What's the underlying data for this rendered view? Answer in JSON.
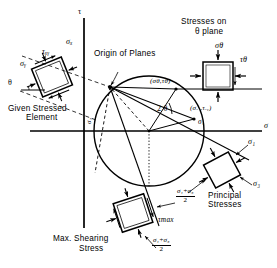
{
  "figure": {
    "type": "mohrs-circle-diagram",
    "title_implicit": "Mohr's Circle with Origin of Planes",
    "axes": {
      "vertical_label": "τ",
      "horizontal_label": "σ",
      "origin_px": [
        84,
        131
      ]
    },
    "colors": {
      "ink": "#000000",
      "paper": "#ffffff"
    },
    "annotations": {
      "origin_of_planes": "Origin of Planes",
      "given_stressed_element_line1": "Given  Stressed",
      "given_stressed_element_line2": "Element",
      "stresses_on_theta_line1": "Stresses on",
      "stresses_on_theta_line2": "θ plane",
      "principal_stresses_line1": "Principal",
      "principal_stresses_line2": "Stresses",
      "max_shearing_line1": "Max.  Shearing",
      "max_shearing_line2": "Stress",
      "angle_two_theta": "2 θ",
      "theta_angle": "θ"
    },
    "points": {
      "sigma_theta_tau_theta": "(σθ,τθ)",
      "sigma_x_tau_xy": "(σₓ ,τₓᵧ)"
    },
    "stress_symbols": {
      "sigma_x": "σₓ",
      "sigma_y": "σᵧ",
      "tau_xy": "τₓᵧ",
      "sigma_theta": "σθ",
      "tau_theta": "τθ",
      "sigma_1": "σ₁",
      "sigma_3": "σ₃",
      "sigma_1_right": "σ₁",
      "sigma_3_right": "σ₃",
      "tau_max": "τmax"
    },
    "fractions": {
      "mean_stress_numerator": "σ₁+σ₃",
      "mean_stress_denominator": "2"
    },
    "geometry": {
      "circle_center_px": [
        149,
        131
      ],
      "circle_radius_px": 55,
      "origin_of_planes_px": [
        110,
        87
      ],
      "sigma_theta_point_px": [
        176,
        89
      ],
      "sigma_x_point_px": [
        193,
        119
      ],
      "sigma_1_px": [
        204,
        131
      ],
      "sigma_3_px": [
        94,
        131
      ],
      "tau_max_px": [
        143,
        186
      ]
    }
  }
}
